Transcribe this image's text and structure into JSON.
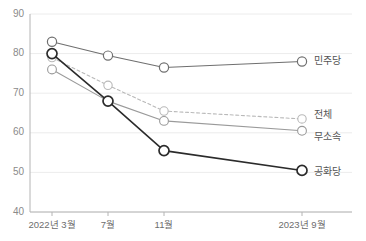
{
  "chart_data": {
    "type": "line",
    "title": "",
    "subtitle": "",
    "xlabel": "",
    "ylabel": "",
    "categories": [
      "2022년 3월",
      "7월",
      "11월",
      "2023년 9월"
    ],
    "x_positions": [
      52,
      108,
      164,
      302
    ],
    "ylim": [
      40,
      90
    ],
    "yticks": [
      40,
      50,
      60,
      70,
      80,
      90
    ],
    "ytick_labels": [
      "40",
      "50",
      "60",
      "70",
      "80",
      "90"
    ],
    "grid": true,
    "legend_position": "right-inline",
    "series": [
      {
        "name": "민주당",
        "values": [
          83,
          79.5,
          76.5,
          78
        ],
        "color": "#6f6f6f",
        "style": "solid",
        "width": 1.1,
        "marker_radius": 4.6,
        "marker_stroke": 1.2,
        "label_y": 61
      },
      {
        "name": "전체",
        "values": [
          79,
          72,
          65.5,
          63.5
        ],
        "color": "#b9b9b9",
        "style": "dashed",
        "width": 1.1,
        "marker_radius": 4.2,
        "marker_stroke": 1.1,
        "label_y": 115
      },
      {
        "name": "무소속",
        "values": [
          76,
          68,
          63,
          60.5
        ],
        "color": "#9a9a9a",
        "style": "solid",
        "width": 1.1,
        "marker_radius": 4.4,
        "marker_stroke": 1.1,
        "label_y": 137
      },
      {
        "name": "공화당",
        "values": [
          80,
          68,
          55.5,
          50.5
        ],
        "color": "#2b2b2b",
        "style": "solid",
        "width": 1.6,
        "marker_radius": 5.0,
        "marker_stroke": 1.7,
        "label_y": 172
      }
    ]
  },
  "legend": {
    "items": [
      {
        "label": "민주당"
      },
      {
        "label": "전체"
      },
      {
        "label": "무소속"
      },
      {
        "label": "공화당"
      }
    ]
  },
  "axes": {
    "y": {
      "min": 40,
      "max": 90,
      "ticks": [
        "40",
        "50",
        "60",
        "70",
        "80",
        "90"
      ]
    },
    "x": {
      "ticks": [
        "2022년 3월",
        "7월",
        "11월",
        "2023년 9월"
      ]
    }
  }
}
